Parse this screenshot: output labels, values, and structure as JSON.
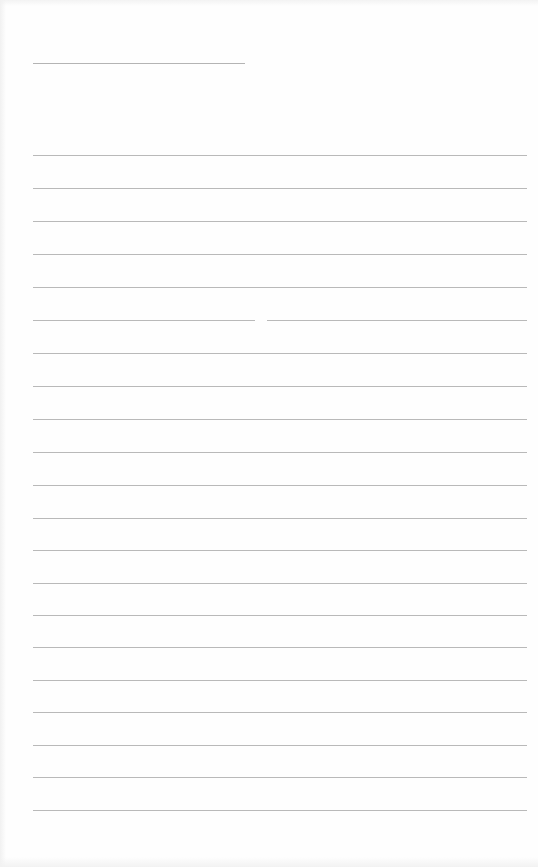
{
  "document": {
    "type": "lined-paper",
    "header_line": {
      "x": 33,
      "y": 63,
      "width": 212
    },
    "rules": {
      "count": 21,
      "left": 33,
      "width": 494,
      "positions_y": [
        155,
        188,
        221,
        254,
        287,
        320,
        353,
        386,
        419,
        452,
        485,
        518,
        550,
        583,
        615,
        647,
        680,
        712,
        745,
        777,
        810
      ],
      "split_index": 5
    },
    "colors": {
      "paper": "#fefefe",
      "rule": "#b9b9b9"
    }
  }
}
